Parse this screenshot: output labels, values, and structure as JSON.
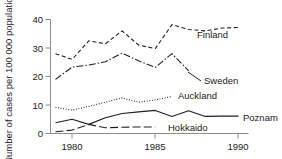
{
  "chart_data": {
    "type": "line",
    "title": "",
    "xlabel": "",
    "ylabel": "Number of cases per 100 000 population",
    "xlim": [
      1978.7,
      1990.6
    ],
    "ylim": [
      0,
      40
    ],
    "xticks": [
      1980,
      1985,
      1990
    ],
    "xtick_labels": [
      "1980",
      "1985",
      "1990"
    ],
    "yticks": [
      0,
      10,
      20,
      30,
      40
    ],
    "ytick_labels": [
      "0",
      "10",
      "20",
      "30",
      "40"
    ],
    "grid": false,
    "legend_position": "inline-right-of-series",
    "series": [
      {
        "name": "Finland",
        "style": "dashed",
        "x": [
          1979,
          1980,
          1981,
          1982,
          1983,
          1984,
          1985,
          1986,
          1987,
          1988,
          1989,
          1990
        ],
        "values": [
          28.0,
          26.0,
          32.5,
          31.5,
          36.0,
          31.0,
          29.8,
          38.2,
          36.5,
          36.0,
          37.0,
          37.2
        ]
      },
      {
        "name": "Sweden",
        "style": "dash-dot",
        "x": [
          1979,
          1980,
          1981,
          1982,
          1983,
          1984,
          1985,
          1986,
          1987
        ],
        "values": [
          19.0,
          23.3,
          24.0,
          25.2,
          28.2,
          25.5,
          23.2,
          28.0,
          22.0
        ]
      },
      {
        "name": "Auckland",
        "style": "dotted",
        "x": [
          1979,
          1980,
          1981,
          1982,
          1983,
          1984,
          1985,
          1986
        ],
        "values": [
          9.2,
          8.2,
          9.5,
          11.0,
          12.5,
          11.0,
          11.8,
          13.0
        ]
      },
      {
        "name": "Poznam",
        "style": "solid",
        "x": [
          1979,
          1980,
          1981,
          1982,
          1983,
          1984,
          1985,
          1986,
          1987,
          1988,
          1989,
          1990
        ],
        "values": [
          3.8,
          5.0,
          3.2,
          5.5,
          7.0,
          7.6,
          8.1,
          6.0,
          8.0,
          6.0,
          6.1,
          6.1
        ]
      },
      {
        "name": "Hokkaido",
        "style": "long-dash",
        "x": [
          1979,
          1980,
          1981,
          1982,
          1983,
          1984,
          1985
        ],
        "values": [
          0.6,
          1.2,
          3.2,
          2.0,
          2.2,
          2.3,
          2.3
        ]
      }
    ],
    "series_labels": [
      {
        "name": "Finland",
        "text": "Finland"
      },
      {
        "name": "Sweden",
        "text": "Sweden"
      },
      {
        "name": "Auckland",
        "text": "Auckland"
      },
      {
        "name": "Poznam",
        "text": "Poznam"
      },
      {
        "name": "Hokkaido",
        "text": "Hokkaido"
      }
    ]
  }
}
